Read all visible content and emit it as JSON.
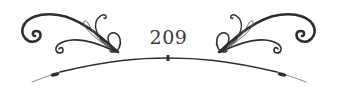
{
  "page": {
    "number": "209"
  },
  "ornament": {
    "style": "flourish-divider",
    "left_flourish_icon": "scroll-flourish-left",
    "right_flourish_icon": "scroll-flourish-right",
    "arc_icon": "curved-rule-with-beads",
    "ink_color": "#2e2e2e",
    "background_color": "#ffffff"
  }
}
